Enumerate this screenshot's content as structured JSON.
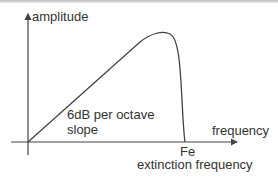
{
  "diagram": {
    "y_axis_label": "amplitude",
    "x_axis_label": "frequency",
    "slope_label_line1": "6dB per octave",
    "slope_label_line2": "slope",
    "cutoff_label": "Fe",
    "cutoff_description": "extinction frequency",
    "colors": {
      "line": "#444444",
      "text": "#333333",
      "background": "#ffffff"
    }
  }
}
